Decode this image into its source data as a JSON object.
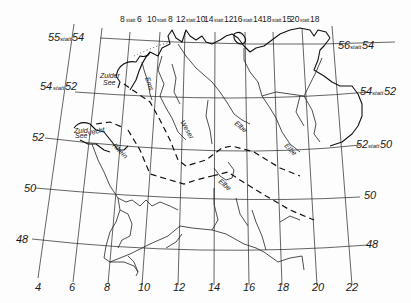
{
  "map": {
    "type": "historical sketch map, central Europe",
    "longitude_labels_bottom": [
      "4",
      "6",
      "8",
      "10",
      "12",
      "14",
      "16",
      "18",
      "20",
      "22"
    ],
    "longitude_labels_top": [
      {
        "value": "8",
        "statt": "statt",
        "original": "6"
      },
      {
        "value": "10",
        "statt": "statt",
        "original": "8"
      },
      {
        "value": "12",
        "statt": "statt",
        "original": "10"
      },
      {
        "value": "14",
        "statt": "statt",
        "original": "12"
      },
      {
        "value": "16",
        "statt": "statt",
        "original": "14"
      },
      {
        "value": "18",
        "statt": "statt",
        "original": "15"
      },
      {
        "value": "20",
        "statt": "statt",
        "original": "18"
      }
    ],
    "latitude_labels_left": [
      {
        "value": "55",
        "statt": "statt",
        "original": "54"
      },
      {
        "value": "54",
        "statt": "statt",
        "original": "52"
      },
      {
        "value": "52",
        "statt": "",
        "original": ""
      },
      {
        "value": "50",
        "statt": "",
        "original": ""
      },
      {
        "value": "48",
        "statt": "",
        "original": ""
      }
    ],
    "latitude_labels_right": [
      {
        "value": "56",
        "statt": "statt",
        "original": "54"
      },
      {
        "value": "54",
        "statt": "statt",
        "original": "52"
      },
      {
        "value": "52",
        "statt": "statt",
        "original": "50"
      },
      {
        "value": "50",
        "statt": "",
        "original": ""
      },
      {
        "value": "48",
        "statt": "",
        "original": ""
      }
    ],
    "place_labels": {
      "zuider_see_1": "Zuider",
      "zuider_see_2": "See",
      "vecht": "Vecht",
      "zuider_see_small_1": "Zuid",
      "zuider_see_small_2": "See",
      "ems": "Ems",
      "weser": "Weser",
      "elbe_1": "Elbe",
      "elbe_2": "Elbe",
      "elbe_3": "Elbe",
      "rhein": "Rhein"
    }
  }
}
